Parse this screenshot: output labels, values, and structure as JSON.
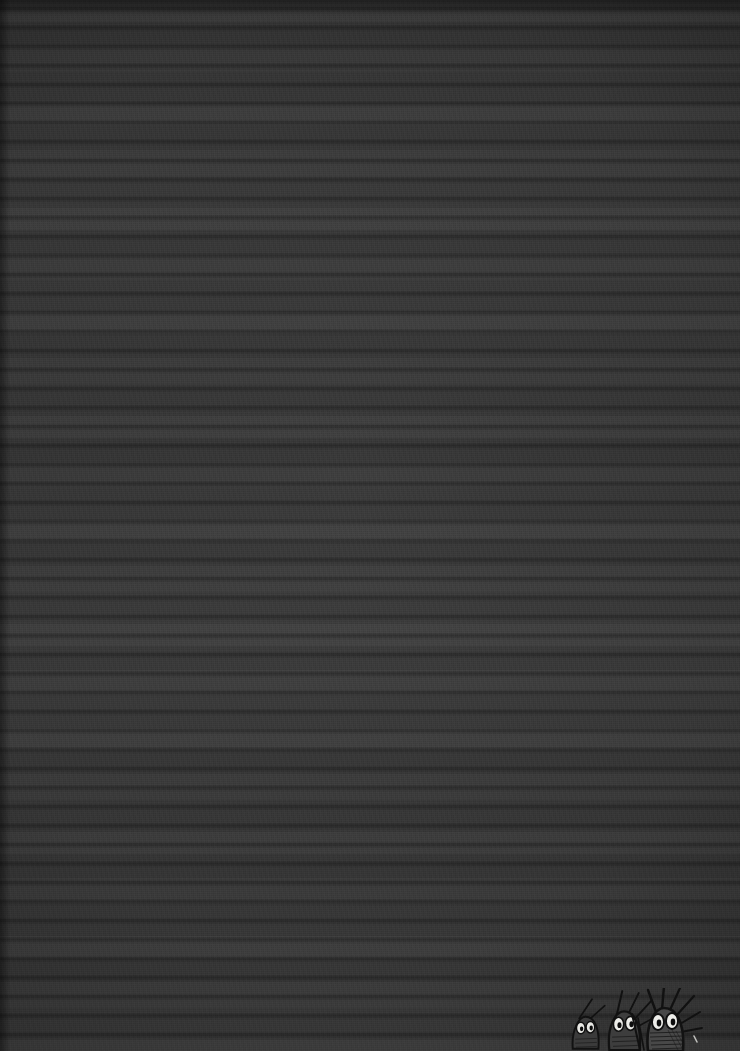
{
  "image": {
    "title": "Dark textured surface with peeking creatures",
    "width": 740,
    "height": 1051,
    "dominant_color": "#3c3c3c",
    "background_tone_light": "#444444",
    "background_tone_dark": "#2e2e2e",
    "texture_description": "near-black horizontally banded woven texture resembling heavily darkened lines of text"
  },
  "figures": {
    "group_label": "three small creatures peeking from bottom edge",
    "count": 3,
    "ink_color": "#141414",
    "eye_white": "#e8e8e4",
    "pupil_color": "#121212",
    "body_fill": "#4a4a4a",
    "items": [
      {
        "name": "creature-left",
        "x": 24,
        "y": 26,
        "scale": 0.8,
        "spikes": 2
      },
      {
        "name": "creature-middle",
        "x": 52,
        "y": 18,
        "scale": 0.92,
        "spikes": 4
      },
      {
        "name": "creature-right",
        "x": 84,
        "y": 12,
        "scale": 1.0,
        "spikes": 6
      }
    ]
  },
  "overlays": {
    "vignette": "radial edge darkening",
    "scanlines": "fine horizontal scanline noise",
    "weave": "vertical fibre weave"
  }
}
